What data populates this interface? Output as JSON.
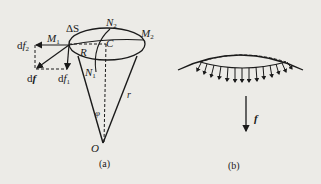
{
  "figure_a": {
    "caption": "(a)",
    "labels": {
      "delta_s": "ΔS",
      "n2_main": "N",
      "n2_sub": "2",
      "m1_main": "M",
      "m1_sub": "1",
      "m2_main": "M",
      "m2_sub": "2",
      "df2_pre": "d",
      "df2_main": "f",
      "df2_sub": "2",
      "df_pre": "d",
      "df_main": "f",
      "df1_pre": "d",
      "df1_main": "f",
      "df1_sub": "1",
      "r_upper": "R",
      "c": "C",
      "n1_main": "N",
      "n1_sub": "1",
      "r_lower": "r",
      "phi": "φ",
      "o": "O"
    }
  },
  "figure_b": {
    "caption": "(b)",
    "labels": {
      "f": "f"
    },
    "arrow_count": 14
  },
  "colors": {
    "ink": "#1a1a1a",
    "background": "#ecebe7"
  }
}
